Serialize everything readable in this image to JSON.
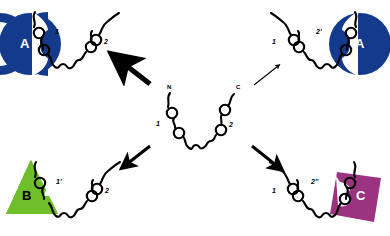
{
  "figure": {
    "type": "diagram"
  },
  "colors": {
    "chain": "#000000",
    "background": "#ffffff",
    "partner_a": "#143a8c",
    "partner_b": "#6fbf2a",
    "partner_c": "#9c3380",
    "arrow": "#000000",
    "label_on_dark": "#ffffff",
    "label_on_light": "#000000"
  },
  "panels": {
    "center": {
      "name": "free-state",
      "terminus_n": "N",
      "terminus_c": "C",
      "site_1": "1",
      "site_2": "2"
    },
    "top_left": {
      "name": "complex-a-site1",
      "partner_label": "A",
      "partner_shape": "semicircle",
      "partner_color": "#143a8c",
      "site_bound": "1",
      "site_free": "2",
      "arrow": {
        "name": "arrow-top-left",
        "direction": "up-left",
        "weight": "thick"
      }
    },
    "top_right": {
      "name": "complex-a-site2prime",
      "partner_label": "A",
      "partner_shape": "semicircle",
      "partner_color": "#143a8c",
      "site_bound": "2'",
      "site_free": "1",
      "arrow": {
        "name": "arrow-top-right",
        "direction": "up-right",
        "weight": "thin"
      }
    },
    "bottom_left": {
      "name": "complex-b-site1prime",
      "partner_label": "B",
      "partner_shape": "triangle",
      "partner_color": "#6fbf2a",
      "site_bound": "1'",
      "site_free": "2",
      "arrow": {
        "name": "arrow-bottom-left",
        "direction": "down-left",
        "weight": "medium"
      }
    },
    "bottom_right": {
      "name": "complex-c-site2doubleprime",
      "partner_label": "C",
      "partner_shape": "square",
      "partner_color": "#9c3380",
      "site_bound": "2''",
      "site_free": "1",
      "arrow": {
        "name": "arrow-bottom-right",
        "direction": "down-right",
        "weight": "medium"
      }
    }
  }
}
